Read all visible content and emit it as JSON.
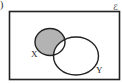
{
  "diagram": {
    "type": "venn",
    "part_marker": ")",
    "universal_set_symbol": "ℰ",
    "sets": [
      {
        "name": "X",
        "label": "X"
      },
      {
        "name": "Y",
        "label": "Y"
      }
    ],
    "shaded_region": "X ∩ Y′",
    "colors": {
      "outline": "#222222",
      "shade": "#b3b3b3",
      "background": "#ffffff"
    }
  }
}
